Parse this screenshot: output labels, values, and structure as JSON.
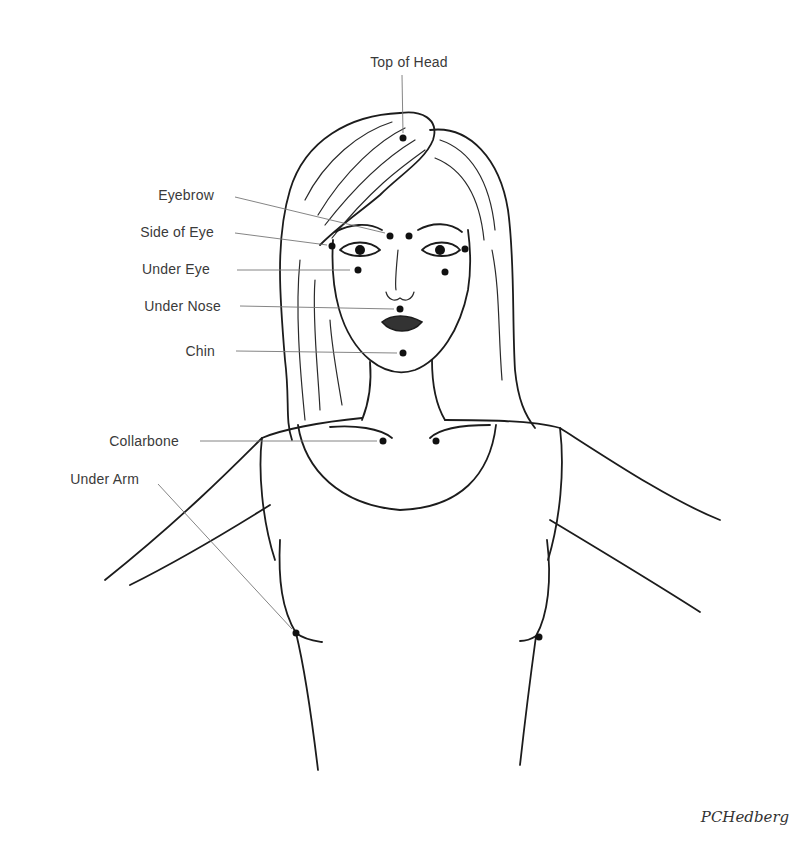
{
  "diagram": {
    "labels": {
      "top_of_head": "Top of Head",
      "eyebrow": "Eyebrow",
      "side_of_eye": "Side of Eye",
      "under_eye": "Under Eye",
      "under_nose": "Under Nose",
      "chin": "Chin",
      "collarbone": "Collarbone",
      "under_arm": "Under Arm"
    },
    "signature": "PCHedberg",
    "colors": {
      "ink": "#1c1c1c",
      "label_text": "#3a3a3a",
      "leader_line": "#777777",
      "background": "#ffffff"
    }
  }
}
